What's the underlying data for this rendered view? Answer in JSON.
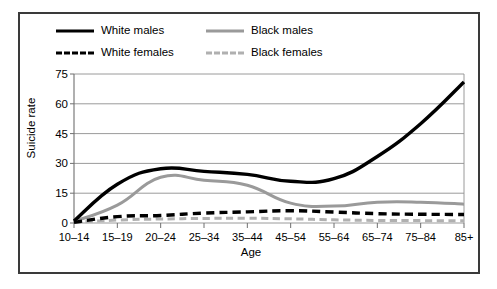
{
  "figure": {
    "border_color": "#3a3a3a",
    "background": "#ffffff"
  },
  "legend": {
    "position": "top-left",
    "entries": [
      {
        "label": "White males",
        "style": "solid",
        "color": "#000000",
        "swatch": "solid-black-line-swatch"
      },
      {
        "label": "Black males",
        "style": "solid",
        "color": "#9a9a9a",
        "swatch": "solid-gray-line-swatch"
      },
      {
        "label": "White females",
        "style": "dashed",
        "color": "#000000",
        "swatch": "dashed-black-line-swatch"
      },
      {
        "label": "Black females",
        "style": "dashed",
        "color": "#b0b0b0",
        "swatch": "dashed-gray-line-swatch"
      }
    ]
  },
  "chart_data": {
    "type": "line",
    "title": "",
    "xlabel": "Age",
    "ylabel": "Suicide rate",
    "categories": [
      "10–14",
      "15–19",
      "20–24",
      "25–34",
      "35–44",
      "45–54",
      "55–64",
      "65–74",
      "75–84",
      "85+"
    ],
    "yticks": [
      0,
      15,
      30,
      45,
      60,
      75
    ],
    "ylim": [
      0,
      75
    ],
    "grid": "horizontal",
    "legend_position": "top-left",
    "series": [
      {
        "name": "White males",
        "color": "#000000",
        "style": "solid",
        "width": 3.4,
        "values": [
          1.0,
          19.5,
          27.3,
          26.0,
          24.5,
          21.0,
          22.3,
          33.5,
          50.0,
          71.0
        ]
      },
      {
        "name": "Black males",
        "color": "#9a9a9a",
        "style": "solid",
        "width": 3.0,
        "values": [
          0.8,
          9.0,
          23.0,
          21.5,
          19.0,
          10.0,
          8.5,
          10.5,
          10.5,
          9.5
        ]
      },
      {
        "name": "White females",
        "color": "#000000",
        "style": "dashed",
        "width": 3.4,
        "values": [
          0.3,
          3.2,
          3.8,
          5.0,
          5.6,
          6.2,
          5.5,
          4.7,
          4.4,
          4.3
        ]
      },
      {
        "name": "Black females",
        "color": "#b0b0b0",
        "style": "dashed",
        "width": 3.0,
        "values": [
          0.2,
          1.5,
          2.0,
          2.3,
          2.4,
          2.1,
          1.6,
          1.3,
          1.2,
          1.1
        ]
      }
    ]
  }
}
